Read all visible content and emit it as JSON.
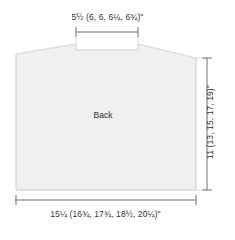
{
  "diagram": {
    "title": "Back",
    "piece_label": "Back",
    "unit_symbol": "\"",
    "fill_color": "#f0f0f0",
    "outline_color": "#cccccc",
    "dimension_line_color": "#666666",
    "text_color": "#333333",
    "top_dimension": {
      "name": "neck-width",
      "text": "5½ (6, 6, 6¼, 6¾)\"",
      "base_value": "5½",
      "alt_values": [
        "6",
        "6",
        "6¼",
        "6¾"
      ]
    },
    "bottom_dimension": {
      "name": "body-width",
      "text": "15¼ (16¾, 17¾, 18½, 20¼)\"",
      "base_value": "15¼",
      "alt_values": [
        "16¾",
        "17¾",
        "18½",
        "20¼"
      ]
    },
    "side_dimension": {
      "name": "body-length",
      "text": "11 (13, 15, 17, 19)\"",
      "base_value": "11",
      "alt_values": [
        "13",
        "15",
        "17",
        "19"
      ]
    }
  }
}
